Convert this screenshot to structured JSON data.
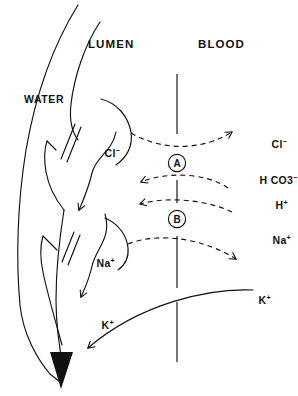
{
  "figure": {
    "background_color": "#ffffff",
    "ink_color": "#111111",
    "width": 298,
    "height": 396
  },
  "compartments": {
    "lumen_label": "LUMEN",
    "blood_label": "BLOOD"
  },
  "water": {
    "label": "WATER",
    "direction": "downward through paracellular/lateral space"
  },
  "exchangers": [
    {
      "id": "A",
      "label": "A",
      "description": "Chloride-bicarbonate exchanger",
      "cx": 177,
      "cy": 163
    },
    {
      "id": "B",
      "label": "B",
      "description": "Sodium-hydrogen exchanger",
      "cx": 177,
      "cy": 219
    }
  ],
  "ions": {
    "cl_cell": {
      "base": "Cl",
      "charge": "−",
      "side": "cell-interior",
      "x": 82,
      "y": 157
    },
    "cl_blood": {
      "base": "Cl",
      "charge": "−",
      "side": "blood",
      "x": 249,
      "y": 148
    },
    "hco3_blood": {
      "base": "H CO3",
      "charge": "−",
      "side": "blood",
      "x": 241,
      "y": 184
    },
    "h_blood": {
      "base": "H",
      "charge": "+",
      "side": "blood",
      "x": 253,
      "y": 208
    },
    "na_blood": {
      "base": "Na",
      "charge": "+",
      "side": "blood",
      "x": 252,
      "y": 244
    },
    "na_cell": {
      "base": "Na",
      "charge": "+",
      "side": "cell-interior",
      "x": 76,
      "y": 267
    },
    "k_blood": {
      "base": "K",
      "charge": "+",
      "side": "blood",
      "x": 238,
      "y": 303
    },
    "k_lumen": {
      "base": "K",
      "charge": "+",
      "side": "lumen",
      "x": 80,
      "y": 328
    }
  },
  "flows": [
    {
      "name": "chloride-to-blood",
      "style": "dashed",
      "from": "cell",
      "to": "blood",
      "via": "A"
    },
    {
      "name": "bicarbonate-to-cell",
      "style": "dashed",
      "from": "blood",
      "to": "cell",
      "via": "A"
    },
    {
      "name": "hydrogen-to-cell",
      "style": "dashed",
      "from": "blood",
      "to": "cell",
      "via": "B"
    },
    {
      "name": "sodium-to-blood",
      "style": "dashed",
      "from": "cell",
      "to": "blood",
      "via": "B"
    },
    {
      "name": "chloride-to-lumen",
      "style": "solid",
      "from": "cell",
      "to": "lumen"
    },
    {
      "name": "sodium-to-lumen",
      "style": "solid",
      "from": "cell",
      "to": "lumen"
    },
    {
      "name": "potassium-to-lumen",
      "style": "solid",
      "from": "blood",
      "to": "lumen"
    },
    {
      "name": "water-downward",
      "style": "solid",
      "from": "lumen",
      "to": "basal"
    }
  ]
}
